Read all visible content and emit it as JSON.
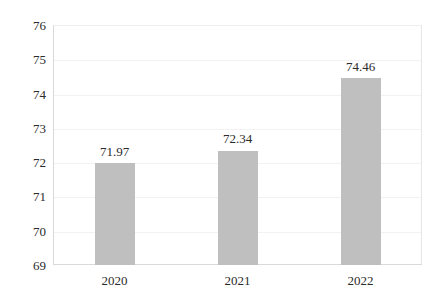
{
  "chart_data": {
    "type": "bar",
    "title": "",
    "subtitle": "",
    "xlabel": "",
    "ylabel": "",
    "categories": [
      "2020",
      "2021",
      "2022"
    ],
    "values": [
      71.97,
      72.34,
      74.46
    ],
    "data_labels": [
      "71.97",
      "72.34",
      "74.46"
    ],
    "ylim": [
      69,
      76
    ],
    "yticks": [
      69,
      70,
      71,
      72,
      73,
      74,
      75,
      76
    ],
    "ytick_labels": [
      "69",
      "70",
      "71",
      "72",
      "73",
      "74",
      "75",
      "76"
    ],
    "grid": true,
    "grid_axis": "y",
    "legend": false,
    "legend_position": "none",
    "series": [
      {
        "name": "",
        "values": [
          71.97,
          72.34,
          74.46
        ],
        "color": "#bfbfbf"
      }
    ],
    "colors": {
      "bar_fill": "#bfbfbf",
      "gridline": "#f2f2f2",
      "axis_line": "#d9d9d9",
      "text": "#2b2b2b",
      "background": "#ffffff"
    }
  }
}
